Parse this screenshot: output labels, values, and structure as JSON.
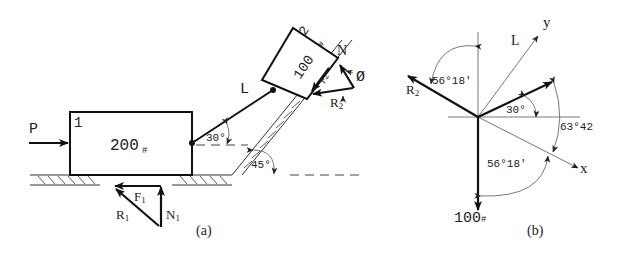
{
  "figure_a": {
    "caption": "(a)",
    "block1": {
      "number": "1",
      "weight": "200",
      "weight_unit": "#"
    },
    "block2": {
      "number": "2",
      "weight": "100",
      "weight_unit": "#"
    },
    "force_P": "P",
    "link_L": "L",
    "angle_link": "30°",
    "angle_incline": "45°",
    "force_triangle_1": {
      "R": "R",
      "R_sub": "1",
      "F": "F",
      "F_sub": "1",
      "N": "N",
      "N_sub": "1"
    },
    "force_triangle_2": {
      "R": "R",
      "R_sub": "2",
      "F": "F",
      "F_sub": "2",
      "N": "N",
      "phi": "Ø"
    }
  },
  "figure_b": {
    "caption": "(b)",
    "axis_x": "x",
    "axis_y": "y",
    "vector_L": "L",
    "vector_R2": "R",
    "vector_R2_sub": "2",
    "weight": "100",
    "weight_unit": "#",
    "angle_30": "30°",
    "angle_R2": "56°18'",
    "angle_weight": "56°18'",
    "angle_63": "63°42"
  }
}
